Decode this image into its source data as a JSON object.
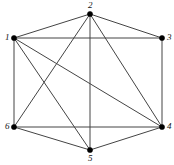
{
  "figure": {
    "background_color": "#ffffff",
    "width": 174,
    "height": 165
  },
  "style": {
    "edge_color": "#444444",
    "edge_width": 1,
    "vertex_color": "#000000",
    "vertex_radius": 2.6,
    "label_color": "#111111",
    "label_font_size": 9
  },
  "chart_data": {
    "type": "diagram",
    "layout": "hexagonal",
    "title": "",
    "xlabel": "",
    "ylabel": "",
    "nodes": [
      {
        "id": "1",
        "label": "1",
        "x": 14,
        "y": 38,
        "label_dx": -9,
        "label_dy": -5,
        "degree": 5
      },
      {
        "id": "2",
        "label": "2",
        "x": 90,
        "y": 14,
        "label_dx": -2,
        "label_dy": -13,
        "degree": 5
      },
      {
        "id": "3",
        "label": "3",
        "x": 162,
        "y": 38,
        "label_dx": 5,
        "label_dy": -5,
        "degree": 3
      },
      {
        "id": "4",
        "label": "4",
        "x": 162,
        "y": 127,
        "label_dx": 5,
        "label_dy": -5,
        "degree": 5
      },
      {
        "id": "5",
        "label": "5",
        "x": 90,
        "y": 150,
        "label_dx": -2,
        "label_dy": 4,
        "degree": 4
      },
      {
        "id": "6",
        "label": "6",
        "x": 14,
        "y": 127,
        "label_dx": -9,
        "label_dy": -5,
        "degree": 4
      }
    ],
    "edges": [
      {
        "source": "1",
        "target": "2"
      },
      {
        "source": "1",
        "target": "3"
      },
      {
        "source": "1",
        "target": "4"
      },
      {
        "source": "1",
        "target": "5"
      },
      {
        "source": "1",
        "target": "6"
      },
      {
        "source": "2",
        "target": "3"
      },
      {
        "source": "2",
        "target": "4"
      },
      {
        "source": "2",
        "target": "5"
      },
      {
        "source": "2",
        "target": "6"
      },
      {
        "source": "3",
        "target": "4"
      },
      {
        "source": "4",
        "target": "5"
      },
      {
        "source": "4",
        "target": "6"
      },
      {
        "source": "5",
        "target": "6"
      }
    ],
    "edge_count": 13,
    "node_count": 6
  }
}
